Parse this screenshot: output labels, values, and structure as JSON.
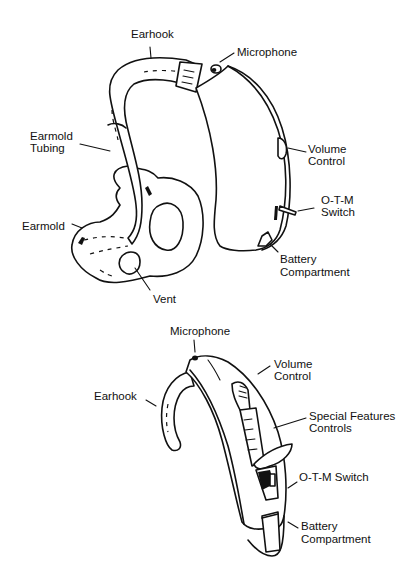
{
  "figure_top": {
    "title": "Behind-the-ear hearing aid with earmold",
    "labels": {
      "earhook": "Earhook",
      "microphone": "Microphone",
      "earmold_tubing_1": "Earmold",
      "earmold_tubing_2": "Tubing",
      "volume_control_1": "Volume",
      "volume_control_2": "Control",
      "otm_switch_1": "O-T-M",
      "otm_switch_2": "Switch",
      "earmold": "Earmold",
      "battery_1": "Battery",
      "battery_2": "Compartment",
      "vent": "Vent"
    }
  },
  "figure_bottom": {
    "title": "Behind-the-ear hearing aid with special features controls",
    "labels": {
      "microphone": "Microphone",
      "volume_control_1": "Volume",
      "volume_control_2": "Control",
      "earhook": "Earhook",
      "special_features_1": "Special Features",
      "special_features_2": "Controls",
      "otm_switch": "O-T-M Switch",
      "battery_1": "Battery",
      "battery_2": "Compartment"
    }
  }
}
